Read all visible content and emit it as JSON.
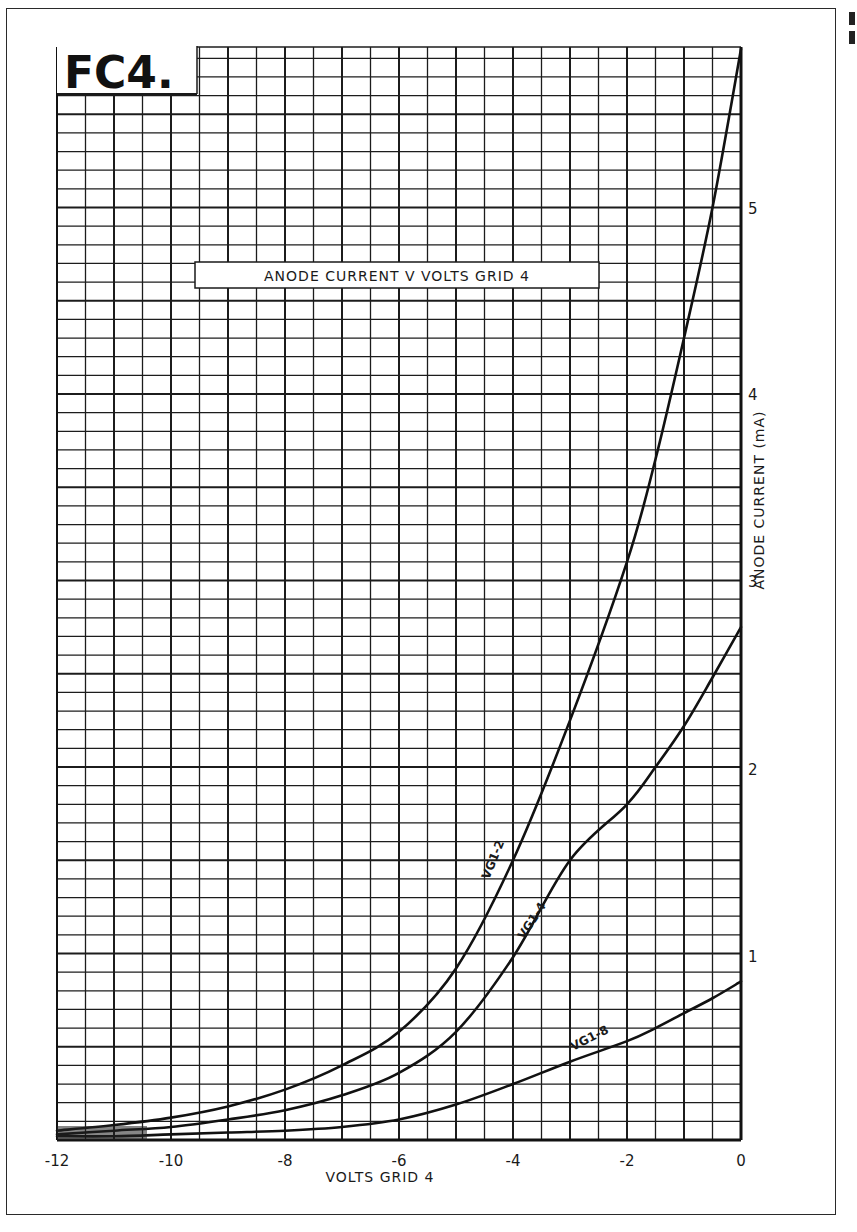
{
  "figure": {
    "badge": "FC4.",
    "title": "ANODE CURRENT  V  VOLTS GRID 4",
    "xlabel": "VOLTS GRID 4",
    "ylabel": "ANODE  CURRENT (mA)"
  },
  "axes": {
    "x_ticks": [
      "-12",
      "-10",
      "-8",
      "-6",
      "-4",
      "-2",
      "0"
    ],
    "y_ticks": [
      "1",
      "2",
      "3",
      "4",
      "5"
    ]
  },
  "curves": {
    "vg1_m2": "VG1-2",
    "vg1_m4": "VG1-4",
    "vg1_m8": "VG1-8"
  },
  "chart_data": {
    "type": "line",
    "title": "ANODE CURRENT V VOLTS GRID 4",
    "badge": "FC4.",
    "xlabel": "VOLTS GRID 4",
    "ylabel": "ANODE CURRENT (mA)",
    "xlim": [
      -12,
      0
    ],
    "ylim": [
      0,
      5.9
    ],
    "x_ticks": [
      -12,
      -10,
      -8,
      -6,
      -4,
      -2,
      0
    ],
    "y_ticks": [
      1,
      2,
      3,
      4,
      5
    ],
    "grid": true,
    "grid_minor_x": 0.5,
    "grid_minor_y": 0.1,
    "x": [
      -12,
      -11,
      -10,
      -9,
      -8,
      -7,
      -6,
      -5,
      -4,
      -3,
      -2,
      -1.5,
      -1,
      -0.5,
      0
    ],
    "series": [
      {
        "name": "VG1-2",
        "values": [
          0.05,
          0.08,
          0.12,
          0.18,
          0.27,
          0.4,
          0.58,
          0.92,
          1.5,
          2.25,
          3.1,
          3.65,
          4.3,
          5.0,
          5.85
        ]
      },
      {
        "name": "VG1-4",
        "values": [
          0.03,
          0.05,
          0.07,
          0.11,
          0.16,
          0.24,
          0.36,
          0.58,
          0.98,
          1.5,
          1.8,
          2.0,
          2.22,
          2.48,
          2.75
        ]
      },
      {
        "name": "VG1-8",
        "values": [
          0.02,
          0.02,
          0.03,
          0.04,
          0.05,
          0.07,
          0.11,
          0.19,
          0.3,
          0.42,
          0.53,
          0.6,
          0.68,
          0.76,
          0.85
        ]
      }
    ]
  }
}
